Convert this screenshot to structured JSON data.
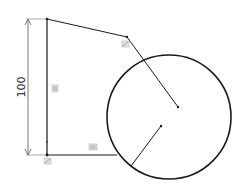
{
  "sketch": {
    "dimension": {
      "value": "100",
      "orientation": "vertical"
    },
    "colors": {
      "line": "#1a1a1a",
      "dimension": "#555555",
      "relation_icon": "#9a9a9a",
      "background": "#ffffff"
    },
    "relations": [
      {
        "name": "vertical-relation-icon",
        "type": "vertical"
      },
      {
        "name": "horizontal-relation-icon",
        "type": "horizontal"
      },
      {
        "name": "tangent-relation-icon-top",
        "type": "tangent"
      },
      {
        "name": "coincident-relation-icon-bottom",
        "type": "coincident"
      }
    ]
  }
}
